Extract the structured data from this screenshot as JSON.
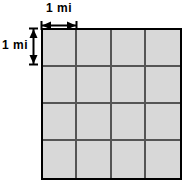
{
  "figure": {
    "title": "",
    "type": "grid-diagram",
    "grid": {
      "columns": 4,
      "rows": 4,
      "total_cells": 16,
      "cell_fill_color": "#d8d8d8",
      "gridline_color": "#555555",
      "border_color": "#000000"
    },
    "labels": {
      "top": {
        "text": "1 mi",
        "unit": "mi",
        "value": "1",
        "orientation": "horizontal",
        "measures": "cell-width"
      },
      "left": {
        "text": "1 mi",
        "unit": "mi",
        "value": "1",
        "orientation": "vertical",
        "measures": "cell-height"
      }
    },
    "arrows": {
      "horizontal": {
        "name": "horizontal-dimension-arrow",
        "double_headed": true
      },
      "vertical": {
        "name": "vertical-dimension-arrow",
        "double_headed": true
      }
    },
    "cells": [
      [
        "",
        "",
        "",
        ""
      ],
      [
        "",
        "",
        "",
        ""
      ],
      [
        "",
        "",
        "",
        ""
      ],
      [
        "",
        "",
        "",
        ""
      ]
    ]
  }
}
